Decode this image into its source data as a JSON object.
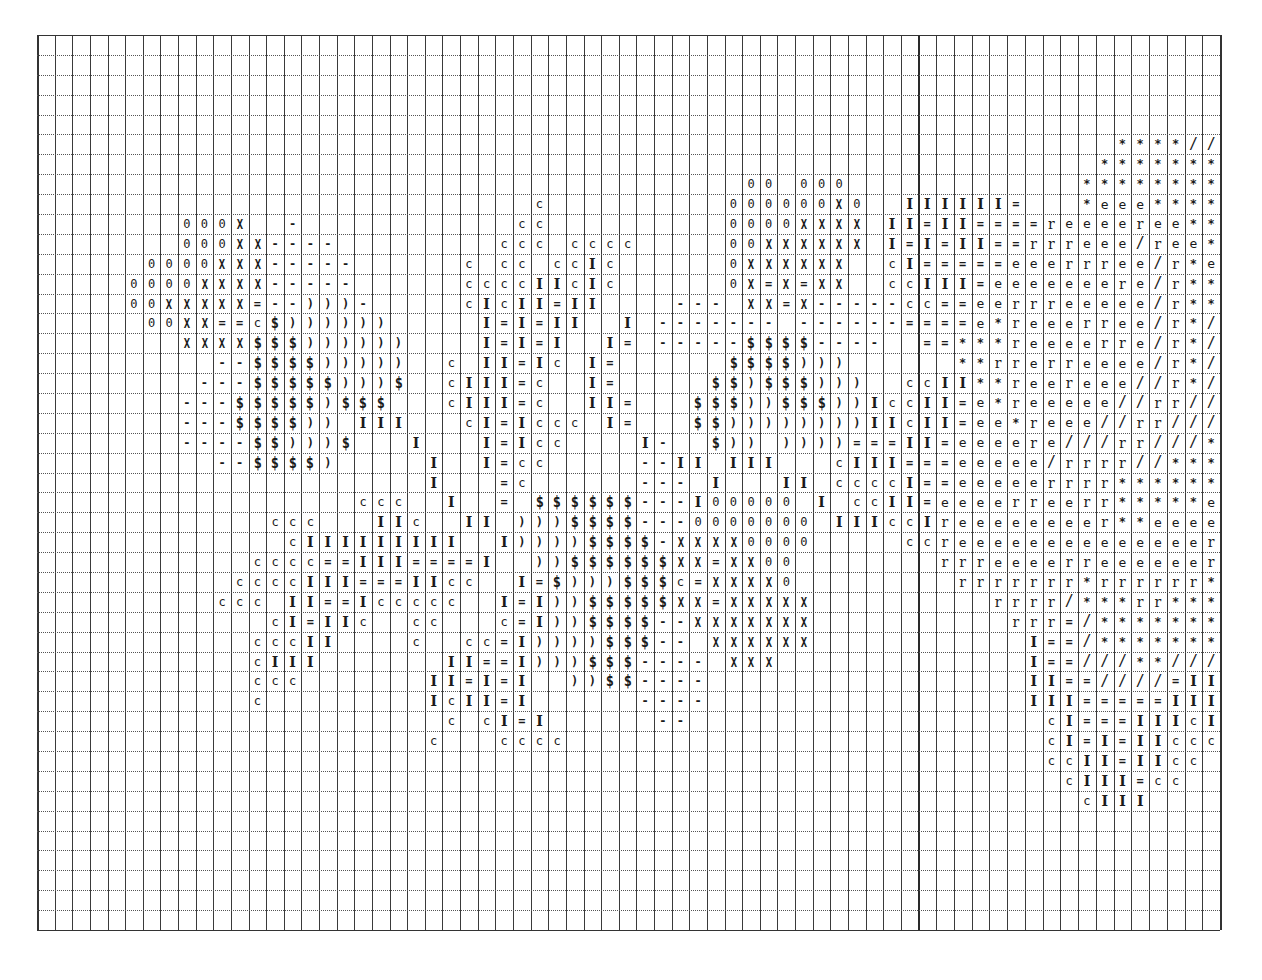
{
  "document": {
    "type": "stitch-pattern-chart",
    "grid": {
      "left": 37,
      "top": 35,
      "rows": 45,
      "row_height": 19.89,
      "pages": [
        {
          "name": "left-sheet",
          "first_col": 0,
          "cols": 50,
          "x": 37,
          "col_width": 17.63
        },
        {
          "name": "right-sheet",
          "first_col": 50,
          "cols": 17,
          "x": 918.3,
          "col_width": 17.75
        }
      ],
      "line_color": "#3a3a3a",
      "background": "#ffffff"
    },
    "legend_symbols": {
      "0": {
        "glyph": "0",
        "cls": "s-0"
      },
      "X": {
        "glyph": "X",
        "cls": "s-X"
      },
      "-": {
        "glyph": "-",
        "cls": "s-dash"
      },
      "=": {
        "glyph": "=",
        "cls": "s-eq"
      },
      ")": {
        "glyph": ")",
        "cls": "s-paren"
      },
      "$": {
        "glyph": "$",
        "cls": "s-dollar"
      },
      "c": {
        "glyph": "c",
        "cls": "s-c"
      },
      "I": {
        "glyph": "I",
        "cls": "s-I"
      },
      "e": {
        "glyph": "e",
        "cls": "s-e"
      },
      "r": {
        "glyph": "r",
        "cls": "s-r"
      },
      "*": {
        "glyph": "*",
        "cls": "s-star"
      },
      "/": {
        "glyph": "/",
        "cls": "s-slash"
      }
    }
  },
  "pattern": {
    "note": "Each row lists runs of [start_col, symbols]; '.' = empty cell",
    "rows": {
      "5": [
        [
          61,
          "****//"
        ]
      ],
      "6": [
        [
          60,
          "*******"
        ]
      ],
      "7": [
        [
          40,
          "00.000"
        ],
        [
          59,
          "********"
        ]
      ],
      "8": [
        [
          28,
          "c"
        ],
        [
          39,
          "000000X0"
        ],
        [
          49,
          "IIIIII="
        ],
        [
          59,
          "*eee****"
        ]
      ],
      "9": [
        [
          8,
          "000X"
        ],
        [
          14,
          "-"
        ],
        [
          27,
          "cc"
        ],
        [
          39,
          "0000XXXX"
        ],
        [
          48,
          "II=II====reeeeree**"
        ]
      ],
      "10": [
        [
          8,
          "000XX----"
        ],
        [
          26,
          "ccc.cccc"
        ],
        [
          39,
          "00XXXXXX"
        ],
        [
          48,
          "I=I=II==rrreee/ree*"
        ]
      ],
      "11": [
        [
          6,
          "0000XXX-----"
        ],
        [
          24,
          "c.cc.ccIc"
        ],
        [
          39,
          "0XXXXXX"
        ],
        [
          48,
          "cI=====eeerrree/r*e"
        ]
      ],
      "12": [
        [
          5,
          "0000XXXX-----"
        ],
        [
          24,
          "ccccIIcIc"
        ],
        [
          39,
          "0X=X=XX"
        ],
        [
          48,
          "ccIII=eeeeeeere/r**"
        ]
      ],
      "13": [
        [
          5,
          "00XXXXX=--)))-"
        ],
        [
          24,
          "cIcII=II"
        ],
        [
          36,
          "---.XX=X-----cc==eerrreeeee/r**"
        ]
      ],
      "14": [
        [
          6,
          "00XX==c$))))))"
        ],
        [
          25,
          "I=I=II"
        ],
        [
          33,
          "I.-------.------====e*reeerree/r*/"
        ]
      ],
      "15": [
        [
          8,
          "XXXX$$$))))))"
        ],
        [
          25,
          "I=I=I"
        ],
        [
          32,
          "I=.-----$$$$----..==***reeeerre/r*/"
        ]
      ],
      "16": [
        [
          10,
          "--$$$$)))))"
        ],
        [
          23,
          "c.II=Ic.I="
        ],
        [
          39,
          "$$$$)))"
        ],
        [
          52,
          "**rrerreeee/r*/"
        ]
      ],
      "17": [
        [
          9,
          "---$$$$$)))$"
        ],
        [
          23,
          "cIII=c..I="
        ],
        [
          38,
          "$$)$$$)))"
        ],
        [
          49,
          "ccII**reereee//r*/"
        ]
      ],
      "18": [
        [
          8,
          "---$$$$$)$$$"
        ],
        [
          23,
          "cIII=c..II="
        ],
        [
          37,
          "$$$))$$$))Icc"
        ],
        [
          50,
          "II=e*reeeee//rr//"
        ]
      ],
      "19": [
        [
          8,
          "---$$$$)).III"
        ],
        [
          24,
          "cI=Iccc.I="
        ],
        [
          37,
          "$$))))))))IIc"
        ],
        [
          50,
          "II=ee*reee//rr///"
        ]
      ],
      "20": [
        [
          8,
          "----$$)))$...I"
        ],
        [
          25,
          "I=Icc"
        ],
        [
          34,
          "I-..$)).))))===I"
        ],
        [
          50,
          "I=eeeere///rr///*"
        ]
      ],
      "21": [
        [
          10,
          "--$$$$)"
        ],
        [
          22,
          "I..I=cc"
        ],
        [
          34,
          "--II.III...cIII="
        ],
        [
          50,
          "==eeeee/rrrr//***"
        ]
      ],
      "22": [
        [
          22,
          "I...=c"
        ],
        [
          34,
          "---.I...II.ccccI"
        ],
        [
          50,
          "==eeeeerrrr******"
        ]
      ],
      "23": [
        [
          18,
          "ccc..I..=.$$$$$$---I00000.I.ccII"
        ],
        [
          50,
          "=eeeerreerr*****e"
        ]
      ],
      "24": [
        [
          13,
          "ccc...IIc..II.)))$$$$---0000000.IIIcc"
        ],
        [
          50,
          "Ireeeeeeeer**eeee"
        ]
      ],
      "25": [
        [
          14,
          "cIIIIIIIII..I))))$$$$-XXXX0000"
        ],
        [
          49,
          "ccreeeeeeeeeeeeeer"
        ]
      ],
      "26": [
        [
          12,
          "cccc==III====I..))$$$$$$XX=XX00"
        ],
        [
          51,
          "rrreeeerreeeeeer"
        ]
      ],
      "27": [
        [
          11,
          "ccccIII===IIcc..I=$)))$$$c=XXXX0"
        ],
        [
          52,
          "rrrrrrr*rrrrrr*"
        ]
      ],
      "28": [
        [
          10,
          "ccc.II==Iccccc..I=I))$$$$$XX=XXXXX"
        ],
        [
          54,
          "rrrr/***rr***"
        ]
      ],
      "29": [
        [
          13,
          "cI=IIc..cc...c=I))$$$$--XXXXXXX"
        ],
        [
          55,
          "rrr=/*******"
        ]
      ],
      "30": [
        [
          12,
          "cccII....c..cc=I))))$$$--.XXXXXX"
        ],
        [
          56,
          "I==/*******"
        ]
      ],
      "31": [
        [
          12,
          "cIII.......II==I)))$$$----.XXX"
        ],
        [
          56,
          "I==///**///"
        ]
      ],
      "32": [
        [
          12,
          "ccc.......II=I=I..))$$----"
        ],
        [
          56,
          "II==////=II"
        ]
      ],
      "33": [
        [
          12,
          "c.........IcII=I......----"
        ],
        [
          56,
          "III=====III"
        ]
      ],
      "34": [
        [
          23,
          "c.cI=I......--"
        ],
        [
          57,
          "cI===IIIcI"
        ]
      ],
      "35": [
        [
          22,
          "c...cccc"
        ],
        [
          57,
          "cI=I=IIccc"
        ]
      ],
      "36": [
        [
          57,
          "ccII=IIcc"
        ]
      ],
      "37": [
        [
          58,
          "cIII=cc"
        ]
      ],
      "38": [
        [
          59,
          "cIII"
        ]
      ]
    }
  }
}
